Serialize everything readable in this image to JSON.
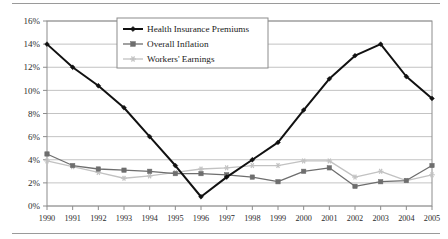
{
  "chart_data": {
    "type": "line",
    "title": "",
    "subtitle": "",
    "xlabel": "",
    "ylabel": "",
    "categories": [
      "1990",
      "1991",
      "1992",
      "1993",
      "1994",
      "1995",
      "1996",
      "1997",
      "1998",
      "1999",
      "2000",
      "2001",
      "2002",
      "2003",
      "2004",
      "2005"
    ],
    "ylim": [
      0,
      16
    ],
    "ytick_labels": [
      "0%",
      "2%",
      "4%",
      "6%",
      "8%",
      "10%",
      "12%",
      "14%",
      "16%"
    ],
    "ytick_values": [
      0,
      2,
      4,
      6,
      8,
      10,
      12,
      14,
      16
    ],
    "grid": "horizontal",
    "legend_position": "top-center",
    "series": [
      {
        "name": "Health Insurance Premiums",
        "color": "#111111",
        "marker": "diamond",
        "values": [
          14.0,
          12.0,
          10.4,
          8.5,
          6.0,
          3.5,
          0.8,
          2.5,
          4.0,
          5.5,
          8.3,
          11.0,
          13.0,
          14.0,
          11.2,
          9.3
        ]
      },
      {
        "name": "Overall Inflation",
        "color": "#6e6e6e",
        "marker": "square",
        "values": [
          4.5,
          3.5,
          3.2,
          3.1,
          3.0,
          2.8,
          2.8,
          2.7,
          2.5,
          2.1,
          3.0,
          3.3,
          1.7,
          2.1,
          2.2,
          3.5
        ]
      },
      {
        "name": "Workers' Earnings",
        "color": "#c2c2c2",
        "marker": "star",
        "values": [
          3.9,
          3.4,
          2.9,
          2.4,
          2.6,
          2.9,
          3.2,
          3.3,
          3.5,
          3.5,
          3.9,
          3.9,
          2.5,
          3.0,
          2.2,
          2.7
        ]
      }
    ]
  },
  "axis": {
    "ytick_labels": [
      "16%",
      "14%",
      "12%",
      "10%",
      "8%",
      "6%",
      "4%",
      "2%",
      "0%"
    ],
    "xtick_labels": [
      "1990",
      "1991",
      "1992",
      "1993",
      "1994",
      "1995",
      "1996",
      "1997",
      "1998",
      "1999",
      "2000",
      "2001",
      "2002",
      "2003",
      "2004",
      "2005"
    ]
  },
  "legend": {
    "items": [
      {
        "label": "Health Insurance Premiums",
        "color": "#111111",
        "marker": "diamond"
      },
      {
        "label": "Overall Inflation",
        "color": "#6e6e6e",
        "marker": "square"
      },
      {
        "label": "Workers' Earnings",
        "color": "#c2c2c2",
        "marker": "star"
      }
    ]
  },
  "colors": {
    "premiums": "#111111",
    "inflation": "#6e6e6e",
    "earnings": "#c2c2c2",
    "grid": "#b4b4b4",
    "frame": "#8c8c8c",
    "rule": "#9a9a9a"
  }
}
